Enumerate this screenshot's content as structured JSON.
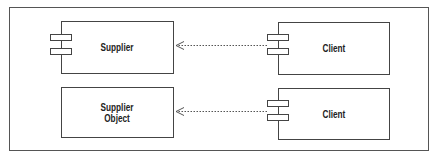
{
  "diagram": {
    "type": "UML component dependency",
    "nodes": [
      {
        "id": "supplier",
        "label": "Supplier",
        "kind": "component"
      },
      {
        "id": "supplier-object",
        "label": "Supplier\nObject",
        "kind": "object"
      },
      {
        "id": "client-1",
        "label": "Client",
        "kind": "component"
      },
      {
        "id": "client-2",
        "label": "Client",
        "kind": "component"
      }
    ],
    "edges": [
      {
        "from": "client-1",
        "to": "supplier",
        "style": "dashed",
        "arrow": "open"
      },
      {
        "from": "client-2",
        "to": "supplier-object",
        "style": "dashed",
        "arrow": "open"
      }
    ]
  },
  "colors": {
    "line": "#444444",
    "text": "#222222",
    "background": "#ffffff"
  }
}
